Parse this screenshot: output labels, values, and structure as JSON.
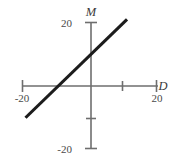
{
  "chart_data": {
    "type": "line",
    "title": "",
    "subtitle": "",
    "xlabel": "D",
    "ylabel": "M",
    "xlim": [
      -20,
      20
    ],
    "ylim": [
      -20,
      20
    ],
    "grid": false,
    "legend": null,
    "x_ticks": [
      {
        "value": -20,
        "label": "-20"
      },
      {
        "value": 10,
        "label": ""
      },
      {
        "value": 20,
        "label": "20"
      }
    ],
    "y_ticks": [
      {
        "value": 20,
        "label": "20"
      },
      {
        "value": -10,
        "label": ""
      },
      {
        "value": -20,
        "label": "-20"
      }
    ],
    "series": [
      {
        "name": "M vs D",
        "slope": 1,
        "intercept": 10,
        "x_intercept": -10,
        "y_intercept": 10,
        "points": [
          {
            "x": -20,
            "y": -10
          },
          {
            "x": -10,
            "y": 0
          },
          {
            "x": 0,
            "y": 10
          },
          {
            "x": 11,
            "y": 21
          }
        ]
      }
    ],
    "annotations": []
  },
  "labels": {
    "y_axis_title": "M",
    "x_axis_title": "D",
    "y_top_tick": "20",
    "y_bottom_tick": "-20",
    "x_left_tick": "-20",
    "x_right_tick": "20"
  },
  "colors": {
    "background": "#ffffff",
    "axis": "#6e6e6e",
    "data_line": "#1c1c1c",
    "tick_text": "#4a4a4a",
    "axis_title_text": "#3a3a3a"
  }
}
